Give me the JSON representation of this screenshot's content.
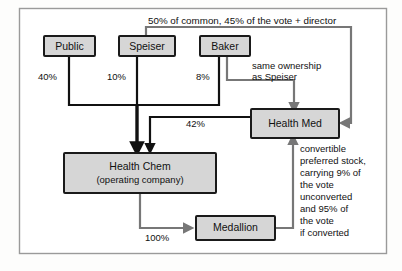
{
  "diagram": {
    "colors": {
      "node_fill": "#d6d6d6",
      "node_border": "#1a1a1a",
      "edge_black": "#111111",
      "edge_gray": "#777777",
      "frame_border": "#9a9a9a",
      "background": "#ffffff"
    },
    "nodes": [
      {
        "id": "public",
        "label": "Public"
      },
      {
        "id": "speiser",
        "label": "Speiser"
      },
      {
        "id": "baker",
        "label": "Baker"
      },
      {
        "id": "health_med",
        "label": "Health Med"
      },
      {
        "id": "health_chem",
        "label_line1": "Health Chem",
        "label_line2": "(operating company)"
      },
      {
        "id": "medallion",
        "label": "Medallion"
      }
    ],
    "edge_labels": {
      "public_pct": "40%",
      "speiser_pct": "10%",
      "baker_pct": "8%",
      "health_med_pct": "42%",
      "medallion_pct": "100%"
    },
    "annotations": {
      "top_note": "50% of common, 45% of the vote + director",
      "baker_note_line1": "same ownership",
      "baker_note_line2": "as Speiser",
      "convertible_note": [
        "convertible",
        "preferred stock,",
        "carrying 9% of",
        "the vote",
        "unconverted",
        "and 95% of",
        "the vote",
        "if converted"
      ]
    }
  }
}
